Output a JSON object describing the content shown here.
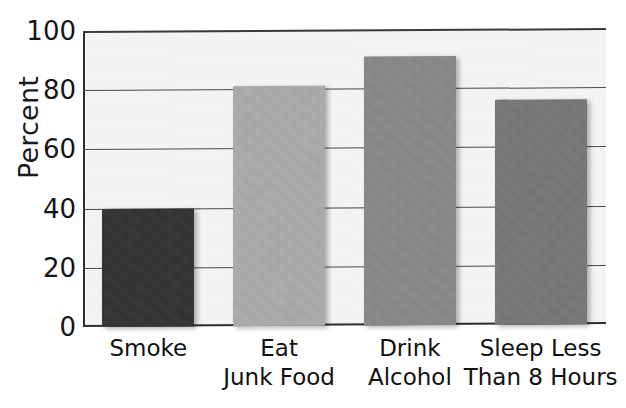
{
  "chart_data": {
    "type": "bar",
    "title": "",
    "xlabel": "",
    "ylabel": "Percent",
    "ylim": [
      0,
      100
    ],
    "yticks": [
      0,
      20,
      40,
      60,
      80,
      100
    ],
    "grid": true,
    "legend": "none",
    "categories": [
      "Smoke",
      "Eat Junk Food",
      "Drink Alcohol",
      "Sleep Less Than 8 Hours"
    ],
    "category_lines": [
      [
        "Smoke",
        ""
      ],
      [
        "Eat",
        "Junk Food"
      ],
      [
        "Drink",
        "Alcohol"
      ],
      [
        "Sleep Less",
        "Than 8 Hours"
      ]
    ],
    "values": [
      40,
      81,
      91,
      76
    ],
    "bar_colors": [
      "#333333",
      "#adadad",
      "#8a8a8a",
      "#787878"
    ],
    "plot_background": "#f4f4f3",
    "axis_color": "#2e2e2e"
  },
  "axis": {
    "y_title": "Percent",
    "tick_labels": [
      "100",
      "80",
      "60",
      "40",
      "20",
      "0"
    ]
  }
}
